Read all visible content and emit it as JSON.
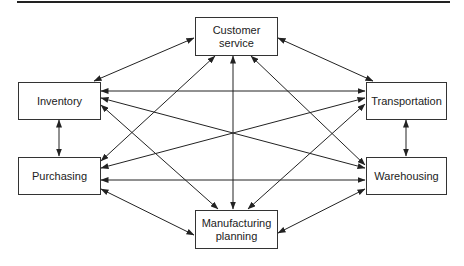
{
  "diagram": {
    "nodes": [
      {
        "id": "customer_service",
        "label_lines": [
          "Customer",
          "service"
        ]
      },
      {
        "id": "inventory",
        "label": "Inventory"
      },
      {
        "id": "transportation",
        "label": "Transportation"
      },
      {
        "id": "purchasing",
        "label": "Purchasing"
      },
      {
        "id": "warehousing",
        "label": "Warehousing"
      },
      {
        "id": "manufacturing_planning",
        "label_lines": [
          "Manufacturing",
          "planning"
        ]
      }
    ],
    "edges": [
      {
        "from": "customer_service",
        "to": "inventory",
        "type": "bidirectional"
      },
      {
        "from": "customer_service",
        "to": "transportation",
        "type": "bidirectional"
      },
      {
        "from": "customer_service",
        "to": "purchasing",
        "type": "bidirectional"
      },
      {
        "from": "customer_service",
        "to": "warehousing",
        "type": "bidirectional"
      },
      {
        "from": "customer_service",
        "to": "manufacturing_planning",
        "type": "bidirectional"
      },
      {
        "from": "inventory",
        "to": "transportation",
        "type": "bidirectional"
      },
      {
        "from": "inventory",
        "to": "warehousing",
        "type": "bidirectional"
      },
      {
        "from": "inventory",
        "to": "purchasing",
        "type": "bidirectional"
      },
      {
        "from": "inventory",
        "to": "manufacturing_planning",
        "type": "bidirectional"
      },
      {
        "from": "purchasing",
        "to": "transportation",
        "type": "bidirectional"
      },
      {
        "from": "purchasing",
        "to": "warehousing",
        "type": "bidirectional"
      },
      {
        "from": "purchasing",
        "to": "manufacturing_planning",
        "type": "bidirectional"
      },
      {
        "from": "transportation",
        "to": "warehousing",
        "type": "bidirectional"
      },
      {
        "from": "transportation",
        "to": "manufacturing_planning",
        "type": "bidirectional"
      },
      {
        "from": "warehousing",
        "to": "manufacturing_planning",
        "type": "bidirectional"
      }
    ]
  }
}
